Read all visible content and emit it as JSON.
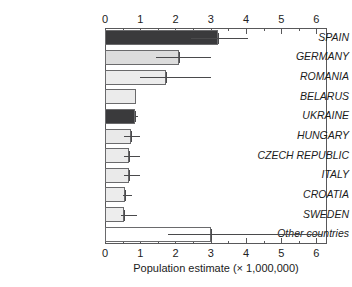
{
  "chart_data": {
    "type": "bar",
    "orientation": "horizontal",
    "title": "",
    "xlabel": "Population estimate (× 1,000,000)",
    "ylabel": "",
    "xlim": [
      0,
      6.3
    ],
    "xticks": [
      0,
      1,
      2,
      3,
      4,
      5,
      6
    ],
    "xtick_labels": [
      "0",
      "1",
      "2",
      "3",
      "4",
      "5",
      "6"
    ],
    "minor_tick_step": 0.5,
    "grid": false,
    "legend": "none",
    "axis_top": true,
    "axis_bottom": true,
    "categories": [
      "SPAIN",
      "GERMANY",
      "ROMANIA",
      "BELARUS",
      "UKRAINE",
      "HUNGARY",
      "CZECH REPUBLIC",
      "ITALY",
      "CROATIA",
      "SWEDEN",
      "Other countries"
    ],
    "values": [
      3.2,
      2.1,
      1.72,
      0.88,
      0.85,
      0.73,
      0.68,
      0.68,
      0.57,
      0.55,
      3.0
    ],
    "error_low": [
      2.45,
      1.45,
      1.0,
      null,
      0.85,
      0.55,
      0.55,
      0.55,
      0.5,
      0.45,
      1.8
    ],
    "error_high": [
      4.05,
      3.0,
      3.0,
      null,
      0.95,
      1.0,
      1.0,
      1.0,
      0.78,
      0.9,
      6.15
    ],
    "bar_fill": [
      "#3a3a3c",
      "#dcdcdc",
      "#ececec",
      "#ebebeb",
      "#3a3a3c",
      "#e9e9e9",
      "#ebebeb",
      "#eaeaea",
      "#ececec",
      "#ededed",
      "#ffffff"
    ],
    "bar_edge": "#6a6a6c",
    "error_color": "#4a4a4c",
    "axis_color": "#58585a"
  }
}
